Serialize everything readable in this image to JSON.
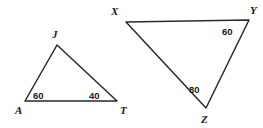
{
  "canvas": {
    "width": 263,
    "height": 128,
    "background": "#ffffff",
    "stroke_color": "#2a2a2a",
    "text_color": "#1a1a1a"
  },
  "figure": {
    "type": "geometry-diagram"
  },
  "triangles": [
    {
      "id": "JAT",
      "name": "triangle-jat",
      "vertices": [
        {
          "key": "J",
          "label": "J",
          "x": 57,
          "y": 45,
          "label_x": 52,
          "label_y": 38
        },
        {
          "key": "A",
          "label": "A",
          "x": 25,
          "y": 101,
          "label_x": 15,
          "label_y": 114
        },
        {
          "key": "T",
          "label": "T",
          "x": 117,
          "y": 101,
          "label_x": 120,
          "label_y": 114
        }
      ],
      "angles": [
        {
          "at": "A",
          "label": "60",
          "value": 60,
          "unit": "degrees",
          "x": 33,
          "y": 99
        },
        {
          "at": "T",
          "label": "40",
          "value": 40,
          "unit": "degrees",
          "x": 89,
          "y": 99
        }
      ]
    },
    {
      "id": "XYZ",
      "name": "triangle-xyz",
      "vertices": [
        {
          "key": "X",
          "label": "X",
          "x": 126,
          "y": 22,
          "label_x": 111,
          "label_y": 15
        },
        {
          "key": "Y",
          "label": "Y",
          "x": 249,
          "y": 20,
          "label_x": 250,
          "label_y": 14
        },
        {
          "key": "Z",
          "label": "Z",
          "x": 206,
          "y": 108,
          "label_x": 201,
          "label_y": 123
        }
      ],
      "angles": [
        {
          "at": "Y",
          "label": "60",
          "value": 60,
          "unit": "degrees",
          "x": 222,
          "y": 35
        },
        {
          "at": "Z",
          "label": "80",
          "value": 80,
          "unit": "degrees",
          "x": 189,
          "y": 93
        }
      ]
    }
  ]
}
